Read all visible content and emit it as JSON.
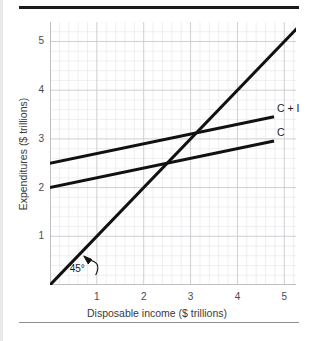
{
  "figure": {
    "background": "#ffffff",
    "rule_color_top": "#1a1a1a",
    "rule_color_bottom": "#8d8d8d"
  },
  "chart_data": {
    "type": "line",
    "title": "",
    "xlabel": "Disposable income ($ trillions)",
    "ylabel": "Expenditures ($ trillions)",
    "xlim": [
      0,
      5.25
    ],
    "ylim": [
      0,
      5.4
    ],
    "xticks": [
      "1",
      "2",
      "3",
      "4",
      "5"
    ],
    "xtick_values": [
      1,
      2,
      3,
      4,
      5
    ],
    "yticks": [
      "1",
      "2",
      "3",
      "4",
      "5"
    ],
    "ytick_values": [
      1,
      2,
      3,
      4,
      5
    ],
    "grid": "on",
    "grid_major_color": "#c9c9cf",
    "grid_minor_color": "#e4e4e8",
    "grid_minor_per_major": 5,
    "legend_position": "right-inline",
    "line_color": "#111111",
    "series": [
      {
        "name": "45°",
        "label": "",
        "kind": "reference",
        "x": [
          0,
          5.25
        ],
        "values": [
          0,
          5.25
        ],
        "slope": 1,
        "intercept": 0
      },
      {
        "name": "C + I",
        "label": "C + I",
        "kind": "expenditure",
        "x": [
          0,
          4.75
        ],
        "values": [
          2.5,
          3.45
        ],
        "slope": 0.2,
        "intercept": 2.5,
        "label_x": 4.8,
        "label_y": 3.62
      },
      {
        "name": "C",
        "label": "C",
        "kind": "expenditure",
        "x": [
          0,
          4.75
        ],
        "values": [
          2.0,
          2.95
        ],
        "slope": 0.2,
        "intercept": 2.0,
        "label_x": 4.8,
        "label_y": 3.12
      }
    ],
    "annotations": [
      {
        "name": "forty-five-degree",
        "text": "45°",
        "x": 0.42,
        "y": 0.33,
        "points_to_x": 0.72,
        "points_to_y": 0.72
      }
    ],
    "intersections": [
      {
        "name": "45-line-with-C",
        "x": 2.5,
        "y": 2.5
      },
      {
        "name": "45-line-with-C-plus-I",
        "x": 3.12,
        "y": 3.12
      }
    ]
  }
}
